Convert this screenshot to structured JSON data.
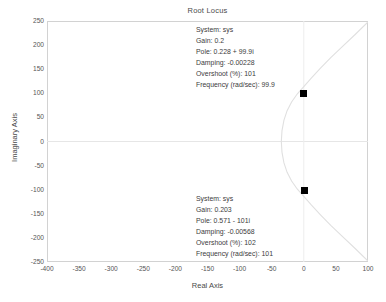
{
  "figure": {
    "title": "Root Locus",
    "background_color": "#ffffff",
    "frame_color": "#d2d2d2"
  },
  "axes": {
    "xlabel": "Real Axis",
    "ylabel": "Imaginary Axis",
    "xticks": [
      "-400",
      "-350",
      "-300",
      "-250",
      "-200",
      "-150",
      "-100",
      "-50",
      "0",
      "50",
      "100"
    ],
    "yticks": [
      "250",
      "200",
      "150",
      "100",
      "50",
      "0",
      "-50",
      "-100",
      "-150",
      "-200",
      "-250"
    ]
  },
  "datatips": [
    {
      "id": "upper",
      "lines": [
        "System: sys",
        "Gain: 0.2",
        "Pole: 0.228 + 99.9i",
        "Damping: -0.00228",
        "Overshoot (%): 101",
        "Frequency (rad/sec): 99.9"
      ]
    },
    {
      "id": "lower",
      "lines": [
        "System: sys",
        "Gain: 0.203",
        "Pole: 0.571 - 101i",
        "Damping: -0.00568",
        "Overshoot (%): 102",
        "Frequency (rad/sec): 102_PLACEHOLDER"
      ]
    }
  ],
  "chart_data": {
    "type": "line",
    "title": "Root Locus",
    "xlabel": "Real Axis",
    "ylabel": "Imaginary Axis",
    "xlim": [
      -400,
      100
    ],
    "ylim": [
      -250,
      250
    ],
    "xticks": [
      -400,
      -350,
      -300,
      -250,
      -200,
      -150,
      -100,
      -50,
      0,
      50,
      100
    ],
    "yticks": [
      -250,
      -200,
      -150,
      -100,
      -50,
      0,
      50,
      100,
      150,
      200,
      250
    ],
    "grid": false,
    "legend": null,
    "locus_color": "#e2e2e2",
    "marker_color": "#000000",
    "series": [
      {
        "name": "root-locus-branch",
        "comment": "Parabola-like branch opening to the right, vertex near (-35, 0), symmetric about the real axis, exiting plot at upper-right and lower-right.",
        "x": [
          -35,
          -34,
          -31,
          -26,
          -19,
          -10,
          0,
          12,
          26,
          42,
          60,
          80,
          100
        ],
        "y": [
          0,
          22,
          44,
          64,
          82,
          99,
          114,
          132,
          152,
          174,
          197,
          222,
          248
        ]
      },
      {
        "name": "root-locus-branch-mirror",
        "x": [
          -35,
          -34,
          -31,
          -26,
          -19,
          -10,
          0,
          12,
          26,
          42,
          60,
          80,
          100
        ],
        "y": [
          0,
          -22,
          -44,
          -64,
          -82,
          -99,
          -114,
          -132,
          -152,
          -174,
          -197,
          -222,
          -248
        ]
      }
    ],
    "markers": [
      {
        "name": "selected-pole-upper",
        "x": 0.228,
        "y": 99.9,
        "gain": 0.2,
        "damping": -0.00228,
        "overshoot_pct": 101,
        "frequency_rad_sec": 99.9
      },
      {
        "name": "selected-pole-lower",
        "x": 0.571,
        "y": -101,
        "gain": 0.203,
        "damping": -0.00568,
        "overshoot_pct": 102,
        "frequency_rad_sec": 101
      }
    ],
    "reference_lines": [
      {
        "name": "real-axis-zero-line",
        "orientation": "horizontal",
        "value": 0
      },
      {
        "name": "imag-axis-zero-line",
        "orientation": "vertical",
        "value": 0
      }
    ]
  }
}
